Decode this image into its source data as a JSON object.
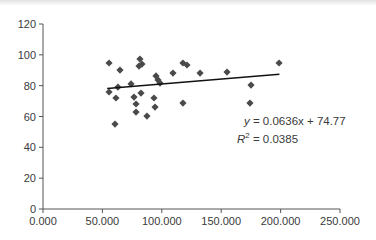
{
  "chart_data": {
    "type": "scatter",
    "title": "",
    "xlabel": "",
    "ylabel": "",
    "xlim": [
      0,
      250
    ],
    "ylim": [
      0,
      120
    ],
    "x_ticks": [
      "0.000",
      "50.000",
      "100.000",
      "150.000",
      "200.000",
      "250.000"
    ],
    "y_ticks": [
      "0",
      "20",
      "40",
      "60",
      "80",
      "100",
      "120"
    ],
    "grid": false,
    "legend": null,
    "marker": "diamond",
    "marker_color": "#4a4a4a",
    "series": [
      {
        "name": "data",
        "points": [
          [
            55.6,
            94.7
          ],
          [
            55.6,
            75.9
          ],
          [
            60.6,
            55.1
          ],
          [
            61.4,
            72.0
          ],
          [
            63.1,
            79.1
          ],
          [
            64.8,
            90.1
          ],
          [
            74.1,
            81.1
          ],
          [
            76.6,
            72.6
          ],
          [
            78.3,
            62.9
          ],
          [
            78.3,
            68.1
          ],
          [
            81.6,
            97.3
          ],
          [
            80.8,
            92.7
          ],
          [
            83.3,
            94.0
          ],
          [
            82.5,
            75.2
          ],
          [
            87.5,
            60.3
          ],
          [
            93.4,
            72.0
          ],
          [
            94.3,
            66.1
          ],
          [
            95.1,
            86.3
          ],
          [
            96.8,
            83.7
          ],
          [
            98.5,
            81.7
          ],
          [
            109.4,
            88.2
          ],
          [
            117.8,
            94.7
          ],
          [
            121.2,
            93.4
          ],
          [
            117.8,
            68.7
          ],
          [
            132.2,
            88.2
          ],
          [
            154.9,
            88.8
          ],
          [
            174.2,
            68.7
          ],
          [
            175.1,
            80.4
          ],
          [
            198.7,
            94.7
          ]
        ]
      }
    ],
    "trendline": {
      "type": "linear",
      "slope": 0.0636,
      "intercept": 74.77,
      "x_range": [
        54,
        199
      ],
      "equation_label": "y = 0.0636x + 74.77",
      "r2_label": "R² = 0.0385",
      "r2": 0.0385
    }
  },
  "annotation": {
    "equation_prefix": "y",
    "equation_rest": " = 0.0636x + 74.77",
    "r2_prefix": "R",
    "r2_sup": "2",
    "r2_rest": " = 0.0385"
  }
}
